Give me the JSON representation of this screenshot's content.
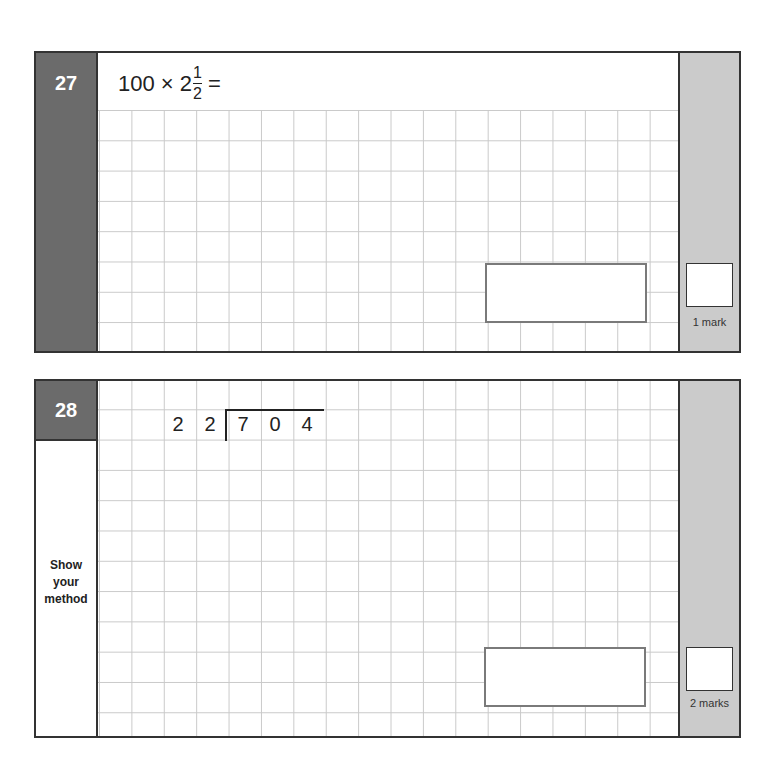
{
  "questions": [
    {
      "number": "27",
      "expression": {
        "lhs": "100 × 2",
        "frac_num": "1",
        "frac_den": "2",
        "eq": "="
      },
      "marks_label": "1 mark"
    },
    {
      "number": "28",
      "division": {
        "divisor": [
          "2",
          "2"
        ],
        "dividend": [
          "7",
          "0",
          "4"
        ]
      },
      "prompt": [
        "Show",
        "your",
        "method"
      ],
      "marks_label": "2 marks"
    }
  ],
  "colors": {
    "number_bg": "#6b6b6b",
    "marks_col": "#cbcbcb",
    "grid": "#c9c9c9",
    "border": "#333333"
  }
}
